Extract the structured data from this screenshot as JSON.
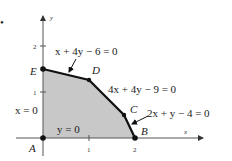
{
  "figure": {
    "bullet": "•",
    "colors": {
      "region_fill": "#c8c8c8",
      "boundary": "#111111",
      "axis": "#555555",
      "text": "#222222"
    },
    "axes": {
      "x_label": "x",
      "y_label": "y",
      "x_ticks": [
        "1",
        "2"
      ],
      "y_ticks": [
        "1",
        "2"
      ]
    },
    "vertices": [
      {
        "label": "A",
        "x": 0,
        "y": 0
      },
      {
        "label": "B",
        "x": 2,
        "y": 0
      },
      {
        "label": "C",
        "x": 1.75,
        "y": 0.5
      },
      {
        "label": "D",
        "x": 1,
        "y": 1.25
      },
      {
        "label": "E",
        "x": 0,
        "y": 1.5
      }
    ],
    "equations": {
      "ed": "x + 4y − 6 = 0",
      "dc": "4x + 4y − 9 = 0",
      "cb": "2x + y − 4 = 0",
      "x0": "x = 0",
      "y0": "y = 0"
    }
  }
}
